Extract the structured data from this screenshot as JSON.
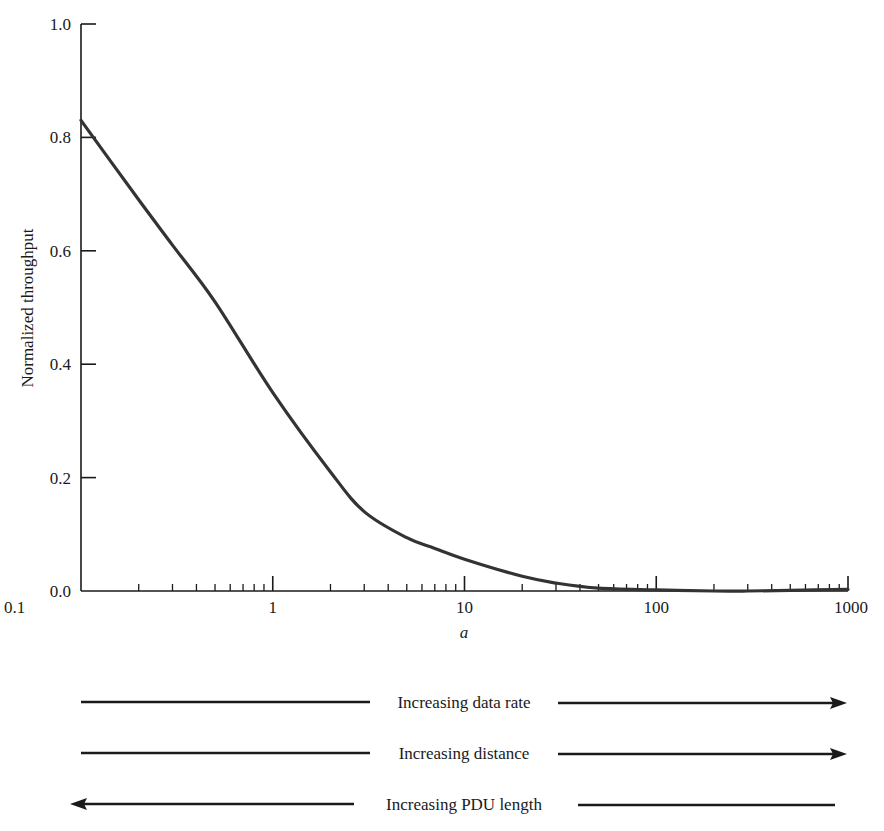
{
  "chart_data": {
    "type": "line",
    "title": "",
    "xlabel": "a",
    "ylabel": "Normalized throughput",
    "xscale": "log",
    "xlim": [
      0.1,
      1000
    ],
    "ylim": [
      0.0,
      1.0
    ],
    "grid": false,
    "legend": null,
    "x_ticks": [
      {
        "value": 0.1,
        "label": "0.1"
      },
      {
        "value": 1,
        "label": "1"
      },
      {
        "value": 10,
        "label": "10"
      },
      {
        "value": 100,
        "label": "100"
      },
      {
        "value": 1000,
        "label": "1000"
      }
    ],
    "y_ticks": [
      {
        "value": 0.0,
        "label": "0.0"
      },
      {
        "value": 0.2,
        "label": "0.2"
      },
      {
        "value": 0.4,
        "label": "0.4"
      },
      {
        "value": 0.6,
        "label": "0.6"
      },
      {
        "value": 0.8,
        "label": "0.8"
      },
      {
        "value": 1.0,
        "label": "1.0"
      }
    ],
    "series": [
      {
        "name": "Normalized throughput",
        "color": "#333333",
        "x": [
          0.1,
          0.2,
          0.3,
          0.5,
          1,
          2,
          3,
          5,
          7,
          10,
          20,
          30,
          50,
          100,
          200,
          300,
          500,
          1000
        ],
        "y": [
          0.83,
          0.69,
          0.61,
          0.51,
          0.35,
          0.21,
          0.14,
          0.094,
          0.075,
          0.056,
          0.026,
          0.014,
          0.005,
          0.002,
          0.0,
          0.0,
          0.001,
          0.003
        ]
      }
    ],
    "annotations": [
      {
        "text": "Increasing data rate",
        "direction": "right"
      },
      {
        "text": "Increasing distance",
        "direction": "right"
      },
      {
        "text": "Increasing PDU length",
        "direction": "left"
      }
    ]
  }
}
